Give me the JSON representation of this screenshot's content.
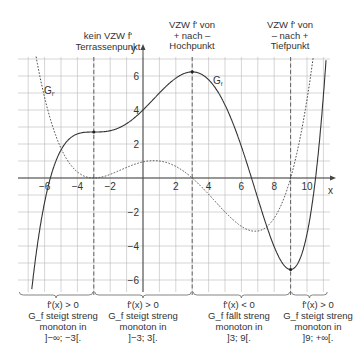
{
  "chart_data": {
    "type": "line",
    "title": "",
    "xlabel": "x",
    "ylabel": "y",
    "xlim": [
      -7.6,
      11.3
    ],
    "ylim": [
      -6.6,
      7.1
    ],
    "grid": true,
    "x_ticks": [
      -6,
      -4,
      -2,
      2,
      4,
      6,
      8,
      10
    ],
    "y_ticks": [
      -6,
      -4,
      -2,
      2,
      4,
      6
    ],
    "series": [
      {
        "name": "G_f",
        "style": "solid",
        "description": "f(x) = 0.0039*(x^5/5 - 1.5x^4 - 12x^3 + 27x^2 + 243x) + 4",
        "key_points": [
          {
            "x": -6.6,
            "y": -6.5
          },
          {
            "x": -5.8,
            "y": 0
          },
          {
            "x": -3,
            "y": 2.7,
            "label": "Terrassenpunkt"
          },
          {
            "x": 0,
            "y": 4
          },
          {
            "x": 3,
            "y": 6.24,
            "label": "Hochpunkt"
          },
          {
            "x": 6.6,
            "y": 0
          },
          {
            "x": 9,
            "y": -5.6,
            "label": "Tiefpunkt"
          },
          {
            "x": 10.7,
            "y": 0
          }
        ]
      },
      {
        "name": "G_f'",
        "style": "dotted",
        "description": "f'(x) = 0.0039*(x+3)^2*(x-3)*(x-9)",
        "key_points": [
          {
            "x": -6.2,
            "y": 7
          },
          {
            "x": -3,
            "y": 0
          },
          {
            "x": 1,
            "y": 1.0
          },
          {
            "x": 3,
            "y": 0
          },
          {
            "x": 7,
            "y": -3.1
          },
          {
            "x": 9,
            "y": 0
          },
          {
            "x": 10.3,
            "y": 7
          }
        ]
      }
    ],
    "vertical_markers": [
      -3,
      3,
      9
    ],
    "annotations": [
      {
        "x": -3,
        "lines": [
          "kein VZW f'",
          "Terrassenpunkt"
        ]
      },
      {
        "x": 3,
        "lines": [
          "VZW f' von",
          "+  nach  –",
          "Hochpunkt"
        ]
      },
      {
        "x": 9,
        "lines": [
          "VZW f' von",
          "–  nach  +",
          "Tiefpunkt"
        ]
      }
    ],
    "intervals": [
      {
        "range": [
          -7.6,
          -3
        ],
        "lines": [
          "f'(x) > 0",
          "G_f steigt streng",
          "monoton in",
          "]−∞; −3[."
        ]
      },
      {
        "range": [
          -3,
          3
        ],
        "lines": [
          "f'(x) > 0",
          "G_f steigt streng",
          "monoton in",
          "]−3; 3[."
        ]
      },
      {
        "range": [
          3,
          9
        ],
        "lines": [
          "f'(x) < 0",
          "G_f fällt streng",
          "monoton in",
          "]3; 9[."
        ]
      },
      {
        "range": [
          9,
          11.3
        ],
        "lines": [
          "f'(x) > 0",
          "G_f steigt streng",
          "monoton in",
          "]9; +∞[."
        ]
      }
    ]
  },
  "labels": {
    "gf_curve": "G",
    "gf_sub": "f",
    "gfp_curve": "G",
    "gfp_sub": "f'",
    "axis_x": "x",
    "axis_y": "y"
  },
  "top_annotations": [
    {
      "l1": "kein VZW f'",
      "l2": "Terrassenpunkt",
      "l3": ""
    },
    {
      "l1": "VZW f' von",
      "l2": "+  nach  –",
      "l3": "Hochpunkt"
    },
    {
      "l1": "VZW f' von",
      "l2": "–  nach  +",
      "l3": "Tiefpunkt"
    }
  ],
  "bottom_blocks": [
    {
      "l1": "f'(x) > 0",
      "l2": "G_f steigt streng",
      "l3": "monoton in",
      "l4": "]−∞; −3[."
    },
    {
      "l1": "f'(x) > 0",
      "l2": "G_f steigt streng",
      "l3": "monoton in",
      "l4": "]−3; 3[."
    },
    {
      "l1": "f'(x) < 0",
      "l2": "G_f fällt streng",
      "l3": "monoton in",
      "l4": "]3; 9[."
    },
    {
      "l1": "f'(x) > 0",
      "l2": "G_f steigt streng",
      "l3": "monoton in",
      "l4": "]9; +∞[."
    }
  ],
  "colors": {
    "grid": "#b8b8b8",
    "axis": "#444444",
    "curve": "#333333",
    "text": "#333333"
  }
}
